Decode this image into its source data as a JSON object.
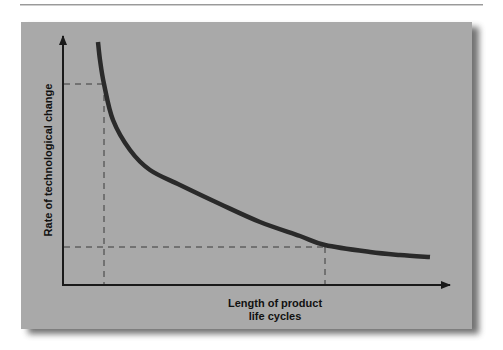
{
  "chart_data": {
    "type": "line",
    "title": "",
    "xlabel": "Length of product life cycles",
    "xlabel_lines": [
      "Length of product",
      "life cycles"
    ],
    "ylabel": "Rate of technological change",
    "grid": false,
    "legend": null,
    "series": [
      {
        "name": "Rate of technological change vs length of product life cycles",
        "shape": "inverse (hyperbolic decay)",
        "points_px": [
          [
            98,
            42
          ],
          [
            100,
            60
          ],
          [
            104,
            84
          ],
          [
            113,
            120
          ],
          [
            130,
            150
          ],
          [
            150,
            170
          ],
          [
            180,
            185
          ],
          [
            220,
            204
          ],
          [
            260,
            222
          ],
          [
            300,
            236
          ],
          [
            325,
            245
          ],
          [
            370,
            252
          ],
          [
            400,
            255
          ],
          [
            430,
            257
          ]
        ]
      }
    ],
    "annotations": [
      {
        "type": "reference",
        "description": "Short product life cycle corresponds to high rate of technological change",
        "x_px": 104,
        "y_px": 84
      },
      {
        "type": "reference",
        "description": "Long product life cycle corresponds to low rate of technological change",
        "x_px": 325,
        "y_px": 247
      }
    ],
    "axes": {
      "x_ticks": [],
      "y_ticks": [],
      "units": "qualitative"
    }
  },
  "colors": {
    "panel": "#a9a9a9",
    "curve": "#2a2a2a",
    "axis": "#1a1a1a",
    "dashed": "#3a3a3a"
  }
}
